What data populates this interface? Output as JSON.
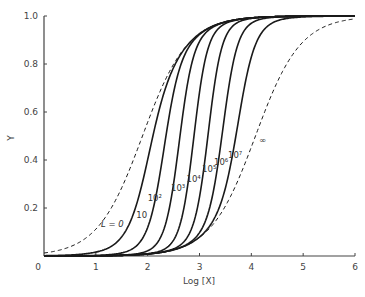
{
  "chart_data": {
    "type": "line",
    "title": "",
    "xlabel": "Log [X]",
    "ylabel": "Y",
    "xlim": [
      0,
      6
    ],
    "ylim": [
      0,
      1.0
    ],
    "x_ticks": [
      "0",
      "1",
      "2",
      "3",
      "4",
      "5",
      "6"
    ],
    "y_ticks": [
      "0.2",
      "0.4",
      "0.6",
      "0.8",
      "1.0"
    ],
    "grid": false,
    "legend": "inline curve labels",
    "model": {
      "n": 4,
      "logKR": 1.9,
      "log_c": -2.18
    },
    "x": [
      0,
      0.5,
      1,
      1.5,
      2,
      2.5,
      3,
      3.5,
      4,
      4.5,
      5,
      5.5,
      6
    ],
    "series": [
      {
        "name": "L = 0",
        "label": "L = 0",
        "style": "dashed",
        "values": [
          0.01,
          0.04,
          0.11,
          0.28,
          0.56,
          0.8,
          0.93,
          0.98,
          0.99,
          1.0,
          1.0,
          1.0,
          1.0
        ]
      },
      {
        "name": "L = 10",
        "label": "10",
        "style": "solid",
        "values": [
          0.0,
          0.01,
          0.03,
          0.12,
          0.42,
          0.79,
          0.93,
          0.98,
          0.99,
          1.0,
          1.0,
          1.0,
          1.0
        ]
      },
      {
        "name": "L = 10^2",
        "label": "10²",
        "style": "solid",
        "values": [
          0.0,
          0.01,
          0.01,
          0.04,
          0.2,
          0.7,
          0.92,
          0.98,
          0.99,
          1.0,
          1.0,
          1.0,
          1.0
        ]
      },
      {
        "name": "L = 10^3",
        "label": "10³",
        "style": "solid",
        "values": [
          0.0,
          0.0,
          0.01,
          0.02,
          0.06,
          0.45,
          0.89,
          0.97,
          0.99,
          1.0,
          1.0,
          1.0,
          1.0
        ]
      },
      {
        "name": "L = 10^4",
        "label": "10⁴",
        "style": "solid",
        "values": [
          0.0,
          0.0,
          0.01,
          0.02,
          0.04,
          0.16,
          0.72,
          0.96,
          0.99,
          1.0,
          1.0,
          1.0,
          1.0
        ]
      },
      {
        "name": "L = 10^5",
        "label": "10⁵",
        "style": "solid",
        "values": [
          0.0,
          0.0,
          0.01,
          0.02,
          0.04,
          0.09,
          0.35,
          0.88,
          0.98,
          1.0,
          1.0,
          1.0,
          1.0
        ]
      },
      {
        "name": "L = 10^6",
        "label": "10⁶",
        "style": "solid",
        "values": [
          0.0,
          0.0,
          0.01,
          0.02,
          0.04,
          0.08,
          0.2,
          0.65,
          0.95,
          0.99,
          1.0,
          1.0,
          1.0
        ]
      },
      {
        "name": "L = 10^7",
        "label": "10⁷",
        "style": "solid",
        "values": [
          0.0,
          0.0,
          0.01,
          0.02,
          0.04,
          0.08,
          0.16,
          0.43,
          0.87,
          0.98,
          1.0,
          1.0,
          1.0
        ]
      },
      {
        "name": "L = ∞",
        "label": "∞",
        "style": "dashed",
        "values": [
          0.0,
          0.0,
          0.01,
          0.02,
          0.04,
          0.08,
          0.22,
          0.42,
          0.69,
          0.87,
          0.96,
          0.99,
          0.99
        ]
      }
    ],
    "annotations": [
      {
        "text": "L = 0",
        "x": 1.1,
        "y": 0.12
      },
      {
        "text": "10",
        "x": 1.78,
        "y": 0.16
      },
      {
        "text": "10²",
        "x": 2.0,
        "y": 0.23
      },
      {
        "text": "10³",
        "x": 2.45,
        "y": 0.27
      },
      {
        "text": "10⁴",
        "x": 2.75,
        "y": 0.31
      },
      {
        "text": "10⁵",
        "x": 3.05,
        "y": 0.35
      },
      {
        "text": "10⁶",
        "x": 3.28,
        "y": 0.38
      },
      {
        "text": "10⁷",
        "x": 3.55,
        "y": 0.41
      },
      {
        "text": "∞",
        "x": 4.15,
        "y": 0.47
      }
    ]
  }
}
